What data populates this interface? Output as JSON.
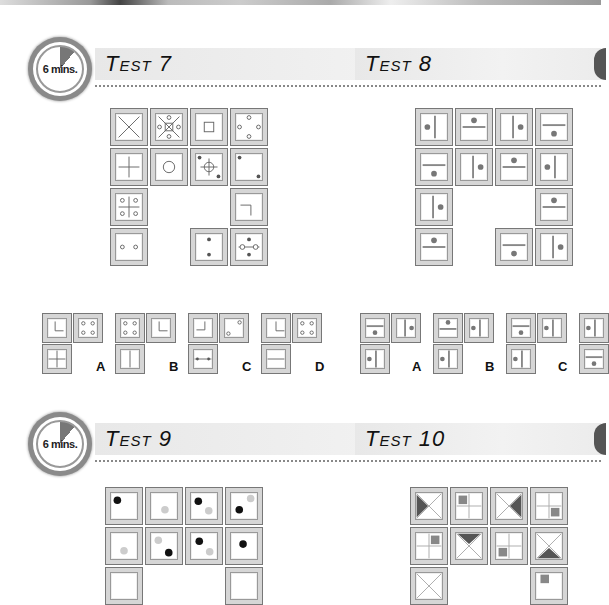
{
  "timer_label": "6 mins.",
  "tests": [
    {
      "id": "test7",
      "title": "Test 7",
      "has_timer": true
    },
    {
      "id": "test8",
      "title": "Test 8",
      "has_timer": false
    },
    {
      "id": "test9",
      "title": "Test 9",
      "has_timer": true
    },
    {
      "id": "test10",
      "title": "Test 10",
      "has_timer": false
    }
  ],
  "test7": {
    "grid": [
      [
        "x-cross",
        "x-with-square-circles",
        "small-square",
        "four-circles-diamond"
      ],
      [
        "plus",
        "circle",
        "crosshair-two-dots",
        "two-dots-diagonal"
      ],
      [
        "plus-four-circles",
        null,
        null,
        "corner-bracket"
      ],
      [
        "two-circles-horizontal",
        null,
        "two-dots-vertical",
        "dots-line-circles"
      ]
    ],
    "options": [
      {
        "label": "A",
        "cells": [
          "corner-L",
          "four-circles",
          "plus"
        ]
      },
      {
        "label": "B",
        "cells": [
          "four-circles",
          "corner-L",
          "vertical-line"
        ]
      },
      {
        "label": "C",
        "cells": [
          "corner-J",
          "two-circles-diagonal",
          "line-with-dots"
        ]
      },
      {
        "label": "D",
        "cells": [
          "corner-L",
          "four-circles",
          "horizontal-line"
        ]
      }
    ]
  },
  "test8": {
    "options": [
      {
        "label": "A"
      },
      {
        "label": "B"
      },
      {
        "label": "C"
      },
      {
        "label": "D"
      }
    ]
  },
  "test9": {
    "visible_rows": 2
  },
  "test10": {
    "visible_rows": 2
  }
}
